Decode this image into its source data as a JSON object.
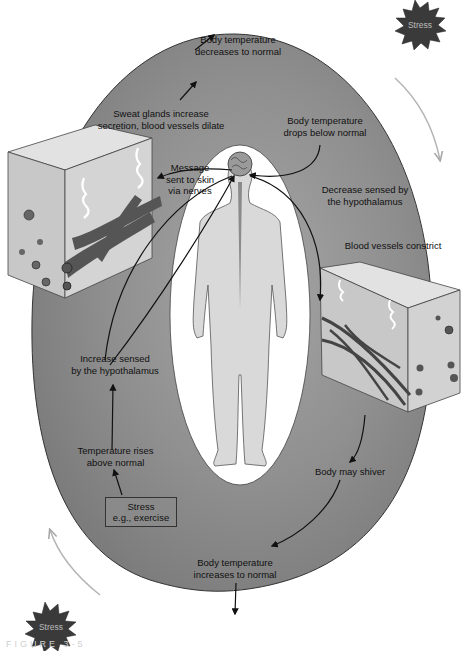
{
  "diagram": {
    "colors": {
      "loop_fill": "#8e8e8e",
      "loop_fill_light": "#a9a9a9",
      "center_oval": "#ffffff",
      "body_fill": "#d7d7d7",
      "skin_fill": "#cfcfcf",
      "vessel_fill": "#555555",
      "burst_fill": "#3a3a3a",
      "stress_box_fill": "#8a8a8a",
      "guide_arrow": "#b4b4b4"
    },
    "labels": {
      "temp_decreases_normal": "Body temperature\ndecreases to normal",
      "sweat_glands": "Sweat glands increase\nsecretion, blood vessels dilate",
      "message_to_skin": "Message\nsent to skin\nvia nerves",
      "temp_drops_below": "Body temperature\ndrops below normal",
      "decrease_sensed": "Decrease sensed by\nthe hypothalamus",
      "vessels_constrict": "Blood vessels constrict",
      "increase_sensed": "Increase sensed\nby the hypothalamus",
      "temp_rises_above": "Temperature rises\nabove normal",
      "stress_exercise": "Stress\ne.g., exercise",
      "body_may_shiver": "Body may shiver",
      "temp_increases_normal": "Body temperature\nincreases to normal"
    },
    "stress_bursts": [
      {
        "position": "top-right",
        "label": "Stress"
      },
      {
        "position": "bottom-left",
        "label": "Stress"
      }
    ],
    "caption": "FIGURE 3-5"
  }
}
